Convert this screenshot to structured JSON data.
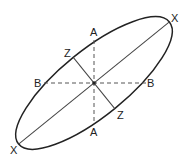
{
  "diagram": {
    "labels": {
      "x_top": "X",
      "x_bottom": "X",
      "a_top": "A",
      "a_bottom": "A",
      "b_left": "B",
      "b_right": "B",
      "z_top": "Z",
      "z_bottom": "Z"
    },
    "colors": {
      "stroke": "#222222",
      "background": "#ffffff"
    }
  }
}
